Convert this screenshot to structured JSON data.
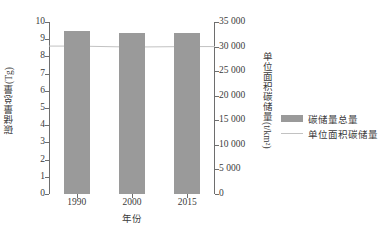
{
  "chart_data": {
    "type": "bar",
    "title": "",
    "subtitle": "",
    "xlabel": "年份",
    "ylabel": "碳储量总量(Tg)",
    "y2label": "单位面积碳储量(t/km²)",
    "categories": [
      "1990",
      "2000",
      "2015"
    ],
    "ylim": [
      0,
      10
    ],
    "yticks": [
      "0",
      "1",
      "2",
      "3",
      "4",
      "5",
      "6",
      "7",
      "8",
      "9",
      "10"
    ],
    "ytickvalues": [
      0,
      1,
      2,
      3,
      4,
      5,
      6,
      7,
      8,
      9,
      10
    ],
    "y2lim": [
      0,
      35000
    ],
    "y2ticks": [
      "0",
      "5 000",
      "10 000",
      "15 000",
      "20 000",
      "25 000",
      "30 000",
      "35 000"
    ],
    "y2tickvalues": [
      0,
      5000,
      10000,
      15000,
      20000,
      25000,
      30000,
      35000
    ],
    "grid": false,
    "legend_position": "right",
    "series": [
      {
        "name": "碳储量总量",
        "kind": "bar",
        "axis": "left",
        "color": "#9a9a9a",
        "values": [
          9.5,
          9.35,
          9.37
        ]
      },
      {
        "name": "单位面积碳储量",
        "kind": "line",
        "axis": "right",
        "color": "#c2c2c2",
        "values": [
          30100,
          29900,
          30000
        ]
      }
    ]
  },
  "legend": {
    "items": [
      {
        "label": "碳储量总量",
        "swatch": "bar-swatch"
      },
      {
        "label": "单位面积碳储量",
        "swatch": "line-swatch"
      }
    ]
  }
}
